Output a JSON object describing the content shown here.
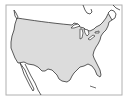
{
  "map": {
    "subject": "Contiguous United States",
    "colors": {
      "background": "#ffffff",
      "land_highlight": "#dcdcdc",
      "land_other": "#ffffff",
      "outline": "#333333",
      "frame": "#b0b0b0",
      "water": "#ffffff"
    },
    "regions": [
      {
        "name": "United States (contiguous)",
        "highlighted": true
      },
      {
        "name": "Canada",
        "highlighted": false
      },
      {
        "name": "Mexico",
        "highlighted": false
      },
      {
        "name": "Great Lakes",
        "highlighted": false
      }
    ]
  }
}
